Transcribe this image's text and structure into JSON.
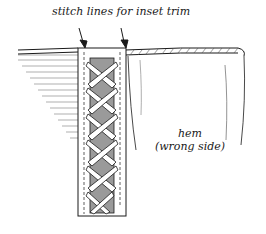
{
  "diagram": {
    "callout_label": "stitch lines for inset trim",
    "hem_label_line1": "hem",
    "hem_label_line2": "(wrong side)",
    "colors": {
      "ink": "#1a1a1a",
      "shading": "#8a8a8a",
      "trim_fill": "#9a9a9a",
      "background": "#ffffff"
    },
    "parts": [
      "fabric-left-panel",
      "fabric-right-panel",
      "rolled-edge-binding",
      "inset-trim-band",
      "lattice-lacing",
      "stitch-lines",
      "callout-arrows"
    ]
  }
}
